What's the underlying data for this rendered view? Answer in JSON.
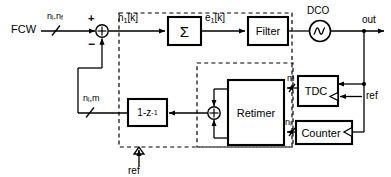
{
  "diagram": {
    "type": "block-diagram",
    "line_color": "#000000",
    "background": "#ffffff"
  },
  "signals": {
    "fcw_label": "FCW",
    "fcw_bus_label_int": "n",
    "fcw_bus_label_int_sub": "i",
    "fcw_bus_label_sep": ".n",
    "fcw_bus_label_frac_sub": "f",
    "phase_error_in": "n",
    "phase_error_in_sub": "1",
    "phase_error_in_idx": "[k]",
    "sum_plus": "+",
    "sum_minus": "−",
    "error_label": "e",
    "error_label_sub": "1",
    "error_label_idx": "[k]",
    "out_label": "out",
    "feedback_label_a": "n",
    "feedback_label_a_sub": "i",
    "feedback_label_b": ",m",
    "m_label": "m",
    "ni_label": "n",
    "ni_label_sub": "i",
    "ref_label_bottom": "ref",
    "ref_label_tdc": "ref"
  },
  "blocks": {
    "accumulator": "Σ",
    "filter": "Filter",
    "dco": "DCO",
    "differentiator_pre": "1-z",
    "differentiator_sup": "-1",
    "retimer": "Retimer",
    "tdc": "TDC",
    "counter": "Counter"
  }
}
